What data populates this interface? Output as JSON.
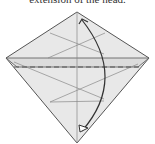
{
  "caption": "extension of the head.",
  "diagram": {
    "type": "origami-fold-step",
    "fold_line": "valley-fold-dashed",
    "arrow": "fold bottom point up to top point",
    "colors": {
      "paper": "#e6e6e6",
      "line": "#777777",
      "edge": "#555555",
      "arrow": "#333333"
    }
  }
}
